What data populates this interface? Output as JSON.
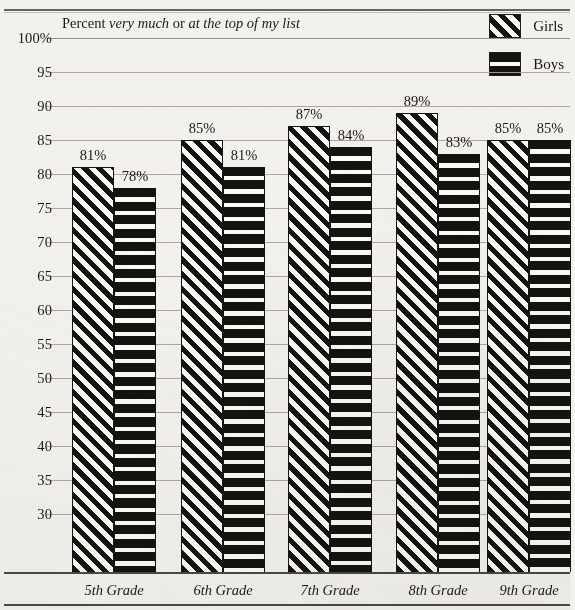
{
  "chart_data": {
    "type": "bar",
    "title": "",
    "subtitle_prefix": "Percent ",
    "subtitle_em1": "very much",
    "subtitle_mid": " or ",
    "subtitle_em2": "at the top of my list",
    "xlabel": "",
    "ylabel": "",
    "ylim": [
      28,
      100
    ],
    "grid": true,
    "legend_position": "top-right",
    "categories": [
      "5th Grade",
      "6th Grade",
      "7th Grade",
      "8th Grade",
      "9th Grade"
    ],
    "ytick_labels": [
      "100%",
      "95",
      "90",
      "85",
      "80",
      "75",
      "70",
      "65",
      "60",
      "55",
      "50",
      "45",
      "40",
      "35",
      "30"
    ],
    "ytick_values": [
      100,
      95,
      90,
      85,
      80,
      75,
      70,
      65,
      60,
      55,
      50,
      45,
      40,
      35,
      30
    ],
    "series": [
      {
        "name": "Girls",
        "fill": "diagonal-hatch",
        "values": [
          81,
          85,
          87,
          89,
          85
        ],
        "value_labels": [
          "81%",
          "85%",
          "87%",
          "89%",
          "85%"
        ]
      },
      {
        "name": "Boys",
        "fill": "horizontal-hatch",
        "values": [
          78,
          81,
          84,
          83,
          85
        ],
        "value_labels": [
          "78%",
          "81%",
          "84%",
          "83%",
          "85%"
        ]
      }
    ]
  },
  "colors": {
    "paper": "#f2f1ee",
    "ink": "#15130f",
    "gridline": "#a6a29a",
    "axis": "#4a4842"
  }
}
